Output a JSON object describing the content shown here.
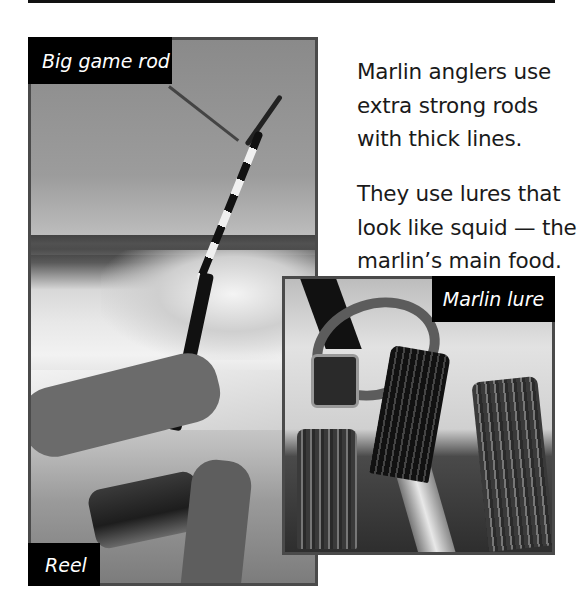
{
  "page": {
    "top_rule": true,
    "body_text": {
      "paragraph_1": [
        "Marlin anglers use",
        "extra strong rods",
        "with thick lines."
      ],
      "paragraph_2": [
        "They use lures that",
        "look like squid — the",
        "marlin’s main food."
      ]
    },
    "photos": {
      "main": {
        "description": "Angler holding a bent big game rod with reel over boat wake",
        "labels": {
          "rod": "Big game rod",
          "reel": "Reel"
        }
      },
      "lure": {
        "description": "Close-up of squid-like marlin lures with skirts and hook",
        "labels": {
          "lure": "Marlin lure"
        }
      }
    },
    "colors": {
      "label_background": "#000000",
      "label_text": "#ffffff",
      "frame_border": "#4a4a4a",
      "body_text": "#1a1a1a",
      "page_background": "#ffffff"
    }
  }
}
